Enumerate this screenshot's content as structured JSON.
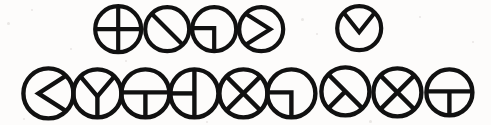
{
  "figure": {
    "background_color": "#fdfcfb",
    "stroke_color": "#111111",
    "canvas": {
      "width": 491,
      "height": 125
    },
    "row_count": 2,
    "symbol_count": 14
  },
  "chart_data": {
    "type": "diagram",
    "rows": [
      {
        "row_index": 1,
        "count": 5,
        "symbols": [
          {
            "id": "r1-s1",
            "name": "circle-quartered-cross",
            "cx": 118,
            "cy": 29,
            "r": 23,
            "stroke": 4.2,
            "strokes": [
              {
                "kind": "line",
                "x1": -23,
                "y1": 0,
                "x2": 23,
                "y2": 0
              },
              {
                "kind": "line",
                "x1": 0,
                "y1": -23,
                "x2": 0,
                "y2": 23
              }
            ]
          },
          {
            "id": "r1-s2",
            "name": "circle-diagonal-backslash",
            "cx": 167,
            "cy": 29,
            "r": 22,
            "stroke": 4.2,
            "strokes": [
              {
                "kind": "line",
                "x1": -15.5,
                "y1": -15.5,
                "x2": 15.5,
                "y2": 15.5
              }
            ]
          },
          {
            "id": "r1-s3",
            "name": "circle-lower-left-quadrant-corner",
            "cx": 214,
            "cy": 29,
            "r": 22,
            "stroke": 4.2,
            "strokes": [
              {
                "kind": "polyline",
                "points": "-22,-1 0,-1 0,22"
              }
            ]
          },
          {
            "id": "r1-s4",
            "name": "circle-right-pointing-wedge",
            "cx": 261,
            "cy": 29,
            "r": 22,
            "stroke": 4.2,
            "strokes": [
              {
                "kind": "polyline",
                "points": "-15.5,-15.5 9,0 -15.5,15.5"
              }
            ]
          },
          {
            "id": "r1-s5",
            "name": "circle-down-pointing-wedge",
            "cx": 359,
            "cy": 28,
            "r": 22,
            "stroke": 4.2,
            "strokes": [
              {
                "kind": "polyline",
                "points": "-15.5,-15.5 0,4 15.5,-15.5"
              }
            ]
          }
        ]
      },
      {
        "row_index": 2,
        "count": 9,
        "symbols": [
          {
            "id": "r2-s1",
            "name": "circle-left-pointing-wedge",
            "cx": 48,
            "cy": 93,
            "r": 25,
            "stroke": 4.4,
            "strokes": [
              {
                "kind": "polyline",
                "points": "17.7,-17.7 -10,0 17.7,17.7"
              }
            ]
          },
          {
            "id": "r2-s2",
            "name": "circle-wye-down",
            "cx": 97,
            "cy": 93,
            "r": 24,
            "stroke": 4.4,
            "strokes": [
              {
                "kind": "polyline",
                "points": "-17,-17 0,3 17,-17"
              },
              {
                "kind": "line",
                "x1": 0,
                "y1": 3,
                "x2": 0,
                "y2": 24
              }
            ]
          },
          {
            "id": "r2-s3",
            "name": "circle-inverted-tee-horizontal-diameter",
            "cx": 145,
            "cy": 93,
            "r": 24,
            "stroke": 4.4,
            "strokes": [
              {
                "kind": "line",
                "x1": -24,
                "y1": -1,
                "x2": 24,
                "y2": -1
              },
              {
                "kind": "line",
                "x1": 0,
                "y1": -1,
                "x2": 0,
                "y2": 24
              }
            ]
          },
          {
            "id": "r2-s4",
            "name": "circle-sideways-tee-vertical-diameter",
            "cx": 194,
            "cy": 93,
            "r": 24,
            "stroke": 4.4,
            "strokes": [
              {
                "kind": "line",
                "x1": 0,
                "y1": -24,
                "x2": 0,
                "y2": 24
              },
              {
                "kind": "line",
                "x1": -24,
                "y1": 0,
                "x2": 0,
                "y2": 0
              }
            ]
          },
          {
            "id": "r2-s5",
            "name": "circle-full-cross-x",
            "cx": 243,
            "cy": 93,
            "r": 24,
            "stroke": 4.4,
            "strokes": [
              {
                "kind": "line",
                "x1": -17,
                "y1": -17,
                "x2": 17,
                "y2": 17
              },
              {
                "kind": "line",
                "x1": 17,
                "y1": -17,
                "x2": -17,
                "y2": 17
              }
            ]
          },
          {
            "id": "r2-s6",
            "name": "circle-lower-left-quadrant-corner",
            "cx": 291,
            "cy": 93,
            "r": 24,
            "stroke": 4.4,
            "strokes": [
              {
                "kind": "polyline",
                "points": "-24,-1 0,-1 0,24"
              }
            ]
          },
          {
            "id": "r2-s7",
            "name": "circle-diagonal-with-lower-left-radius",
            "cx": 345,
            "cy": 91,
            "r": 24,
            "stroke": 4.4,
            "strokes": [
              {
                "kind": "line",
                "x1": -17,
                "y1": -17,
                "x2": 17,
                "y2": 17
              },
              {
                "kind": "line",
                "x1": 0,
                "y1": 0,
                "x2": -17,
                "y2": 17
              }
            ]
          },
          {
            "id": "r2-s8",
            "name": "circle-full-cross-x",
            "cx": 397,
            "cy": 92,
            "r": 24,
            "stroke": 4.4,
            "strokes": [
              {
                "kind": "line",
                "x1": -17,
                "y1": -17,
                "x2": 17,
                "y2": 17
              },
              {
                "kind": "line",
                "x1": 17,
                "y1": -17,
                "x2": -17,
                "y2": 17
              }
            ]
          },
          {
            "id": "r2-s9",
            "name": "circle-inverted-tee-horizontal-diameter",
            "cx": 449,
            "cy": 92,
            "r": 23,
            "stroke": 4.4,
            "strokes": [
              {
                "kind": "line",
                "x1": -23,
                "y1": -1,
                "x2": 23,
                "y2": -1
              },
              {
                "kind": "line",
                "x1": 0,
                "y1": -1,
                "x2": 0,
                "y2": 23
              }
            ]
          }
        ]
      }
    ]
  },
  "specks": [
    {
      "x": 7,
      "y": 22,
      "size": 3
    },
    {
      "x": 31,
      "y": 9,
      "size": 2
    },
    {
      "x": 70,
      "y": 48,
      "size": 2
    },
    {
      "x": 301,
      "y": 18,
      "size": 3
    },
    {
      "x": 316,
      "y": 33,
      "size": 2
    },
    {
      "x": 419,
      "y": 16,
      "size": 2
    },
    {
      "x": 472,
      "y": 41,
      "size": 2
    },
    {
      "x": 23,
      "y": 118,
      "size": 2
    },
    {
      "x": 206,
      "y": 121,
      "size": 2
    },
    {
      "x": 369,
      "y": 120,
      "size": 3
    },
    {
      "x": 462,
      "y": 112,
      "size": 2
    },
    {
      "x": 125,
      "y": 60,
      "size": 2
    }
  ]
}
